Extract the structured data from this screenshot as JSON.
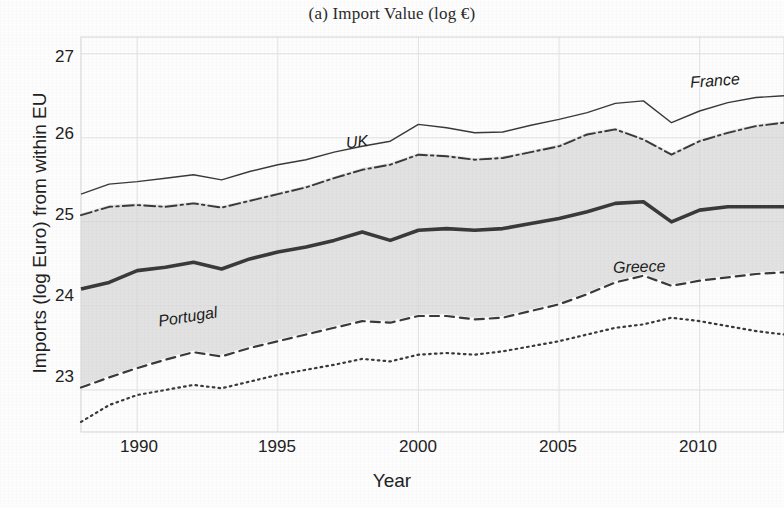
{
  "figure": {
    "title": "(a) Import Value (log €)",
    "xlabel": "Year",
    "ylabel": "Imports (log Euro) from within EU"
  },
  "axes": {
    "yticks": [
      "23",
      "24",
      "25",
      "26",
      "27"
    ],
    "xticks": [
      "1990",
      "1995",
      "2000",
      "2005",
      "2010"
    ]
  },
  "labels": {
    "france": "France",
    "uk": "UK",
    "portugal": "Portugal",
    "greece": "Greece"
  },
  "colors": {
    "line": "#3a3a3a",
    "band": "#d8d8d8",
    "grid": "#e2e2e2",
    "text": "#1c1c1c"
  },
  "chart_data": {
    "type": "line",
    "title": "(a) Import Value (log €)",
    "xlabel": "Year",
    "ylabel": "Imports (log Euro) from within EU",
    "xlim": [
      1988,
      2013
    ],
    "ylim": [
      22.5,
      27.2
    ],
    "xticks": [
      1990,
      1995,
      2000,
      2005,
      2010
    ],
    "yticks": [
      23,
      24,
      25,
      26,
      27
    ],
    "grid": true,
    "legend": "inline-annotations",
    "x": [
      1988,
      1989,
      1990,
      1991,
      1992,
      1993,
      1994,
      1995,
      1996,
      1997,
      1998,
      1999,
      2000,
      2001,
      2002,
      2003,
      2004,
      2005,
      2006,
      2007,
      2008,
      2009,
      2010,
      2011,
      2012,
      2013
    ],
    "series": [
      {
        "name": "France",
        "style": "solid-thin",
        "values": [
          25.33,
          25.45,
          25.48,
          25.52,
          25.56,
          25.5,
          25.6,
          25.68,
          25.74,
          25.83,
          25.9,
          25.96,
          26.16,
          26.12,
          26.06,
          26.07,
          26.15,
          26.22,
          26.3,
          26.41,
          26.44,
          26.18,
          26.32,
          26.42,
          26.48,
          26.5
        ]
      },
      {
        "name": "UK",
        "style": "dash-dot",
        "values": [
          25.08,
          25.18,
          25.2,
          25.18,
          25.22,
          25.17,
          25.25,
          25.33,
          25.41,
          25.52,
          25.62,
          25.68,
          25.8,
          25.78,
          25.74,
          25.76,
          25.83,
          25.9,
          26.04,
          26.1,
          25.98,
          25.8,
          25.96,
          26.06,
          26.14,
          26.18
        ]
      },
      {
        "name": "EU average",
        "style": "solid-thick",
        "values": [
          24.2,
          24.28,
          24.42,
          24.46,
          24.52,
          24.44,
          24.56,
          24.64,
          24.7,
          24.78,
          24.88,
          24.78,
          24.9,
          24.92,
          24.9,
          24.92,
          24.98,
          25.04,
          25.12,
          25.22,
          25.24,
          25.0,
          25.14,
          25.18,
          25.18,
          25.18
        ]
      },
      {
        "name": "Portugal",
        "style": "dashed",
        "values": [
          23.03,
          23.15,
          23.26,
          23.36,
          23.45,
          23.4,
          23.5,
          23.58,
          23.66,
          23.74,
          23.82,
          23.8,
          23.88,
          23.88,
          23.84,
          23.86,
          23.94,
          24.02,
          24.14,
          24.28,
          24.36,
          24.24,
          24.3,
          24.34,
          24.38,
          24.4
        ]
      },
      {
        "name": "Greece",
        "style": "dotted",
        "values": [
          22.62,
          22.82,
          22.94,
          23.0,
          23.06,
          23.02,
          23.1,
          23.18,
          23.24,
          23.3,
          23.37,
          23.34,
          23.42,
          23.44,
          23.42,
          23.46,
          23.52,
          23.58,
          23.66,
          23.74,
          23.78,
          23.86,
          23.82,
          23.76,
          23.7,
          23.66
        ]
      }
    ],
    "band": {
      "name": "interquartile range",
      "upper": [
        25.1,
        25.2,
        25.22,
        25.2,
        25.24,
        25.19,
        25.27,
        25.35,
        25.43,
        25.54,
        25.64,
        25.7,
        25.82,
        25.8,
        25.76,
        25.78,
        25.85,
        25.92,
        26.06,
        26.12,
        26.0,
        25.82,
        25.98,
        26.08,
        26.16,
        26.2
      ],
      "lower": [
        23.05,
        23.17,
        23.28,
        23.38,
        23.47,
        23.42,
        23.52,
        23.6,
        23.68,
        23.76,
        23.84,
        23.82,
        23.9,
        23.9,
        23.86,
        23.88,
        23.96,
        24.04,
        24.16,
        24.3,
        24.38,
        24.26,
        24.32,
        24.36,
        24.4,
        24.42
      ]
    }
  }
}
